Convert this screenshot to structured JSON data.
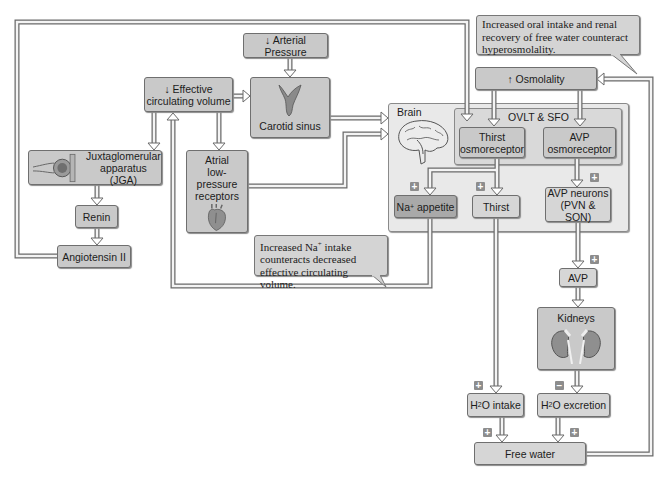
{
  "diagram": {
    "nodes": {
      "arterial_pressure": "↓ Arterial Pressure",
      "carotid_sinus": "Carotid sinus",
      "effective_volume_line1": "↓ Effective",
      "effective_volume_line2": "circulating volume",
      "jga_line1": "Juxtaglomerular",
      "jga_line2": "apparatus (JGA)",
      "atrial_line1": "Atrial",
      "atrial_line2": "low-pressure",
      "atrial_line3": "receptors",
      "renin": "Renin",
      "angiotensin": "Angiotensin II",
      "brain": "Brain",
      "ovlt_sfo": "OVLT & SFO",
      "thirst_osmo_line1": "Thirst",
      "thirst_osmo_line2": "osmoreceptor",
      "avp_osmo_line1": "AVP",
      "avp_osmo_line2": "osmoreceptor",
      "na_appetite_prefix": "Na",
      "na_appetite_sup": "+",
      "na_appetite_suffix": " appetite",
      "thirst": "Thirst",
      "avp_neurons_line1": "AVP neurons",
      "avp_neurons_line2": "(PVN & SON)",
      "osmolality": "↑ Osmolality",
      "avp": "AVP",
      "kidneys": "Kidneys",
      "h2o_intake_prefix": "H",
      "h2o_intake_sub": "2",
      "h2o_intake_suffix": "O intake",
      "h2o_excretion_prefix": "H",
      "h2o_excretion_sub": "2",
      "h2o_excretion_suffix": "O excretion",
      "free_water": "Free water"
    },
    "callouts": {
      "top": "Increased oral intake and renal recovery of free water counteract hyperosmolality.",
      "bottom_prefix": "Increased Na",
      "bottom_sup": "+",
      "bottom_suffix": " intake counteracts decreased effective circulating volume."
    },
    "signs": {
      "plus": "+",
      "minus": "−"
    },
    "colors": {
      "box_fill": "#c9c9c9",
      "box_dark": "#a9a9a9",
      "panel_fill": "#e9e9e9",
      "arrow_outline": "#6a6a6a",
      "sign_fill": "#8d8d8d"
    }
  }
}
